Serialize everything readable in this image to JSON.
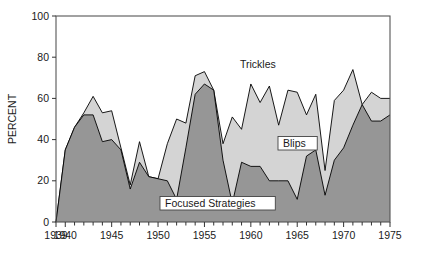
{
  "chart_data": {
    "type": "area",
    "title": "",
    "subtitle": "",
    "xlabel": "",
    "ylabel": "PERCENT",
    "xlim": [
      1939,
      1975
    ],
    "ylim": [
      0,
      100
    ],
    "grid": false,
    "legend_position": "inline-annotations",
    "stacked": true,
    "x": [
      1939,
      1940,
      1941,
      1942,
      1943,
      1944,
      1945,
      1946,
      1947,
      1948,
      1949,
      1950,
      1951,
      1952,
      1953,
      1954,
      1955,
      1956,
      1957,
      1958,
      1959,
      1960,
      1961,
      1962,
      1963,
      1964,
      1965,
      1966,
      1967,
      1968,
      1969,
      1970,
      1971,
      1972,
      1973,
      1974,
      1975
    ],
    "series": [
      {
        "name": "Focused Strategies",
        "color": "#969696",
        "values": [
          0,
          35,
          46,
          52,
          52,
          39,
          40,
          35,
          16,
          29,
          22,
          21,
          20,
          11,
          36,
          62,
          67,
          64,
          30,
          9,
          29,
          27,
          27,
          20,
          20,
          20,
          11,
          32,
          35,
          13,
          30,
          36,
          47,
          57,
          49,
          49,
          52
        ]
      },
      {
        "name": "Trickles and Blips",
        "color": "#d4d4d4",
        "values": [
          0,
          35,
          46,
          53,
          61,
          53,
          54,
          36,
          18,
          39,
          22,
          21,
          38,
          50,
          48,
          71,
          73,
          64,
          38,
          51,
          45,
          67,
          58,
          66,
          47,
          64,
          63,
          52,
          62,
          25,
          59,
          64,
          74,
          57,
          63,
          60,
          60
        ]
      }
    ],
    "xticks_major": [
      1939,
      1940,
      1945,
      1950,
      1955,
      1960,
      1965,
      1970,
      1975
    ],
    "xtick_labels": [
      "1939",
      "1940",
      "1945",
      "1950",
      "1955",
      "1960",
      "1965",
      "1970",
      "1975"
    ],
    "yticks": [
      0,
      20,
      40,
      60,
      80,
      100
    ],
    "ytick_labels": [
      "0",
      "20",
      "40",
      "60",
      "80",
      "100"
    ],
    "annotations": [
      {
        "id": "trickles",
        "label": "Trickles",
        "x_px": 240,
        "y_px": 68,
        "boxed": false
      },
      {
        "id": "blips",
        "label": "Blips",
        "x_px": 280,
        "y_px": 146,
        "boxed": true
      },
      {
        "id": "focused-strategies",
        "label": "Focused Strategies",
        "x_px": 162,
        "y_px": 206,
        "boxed": true
      }
    ],
    "colors": {
      "lower_band": "#969696",
      "upper_band": "#d4d4d4",
      "outline": "#000000",
      "frame": "#555555",
      "background": "#ffffff"
    }
  }
}
